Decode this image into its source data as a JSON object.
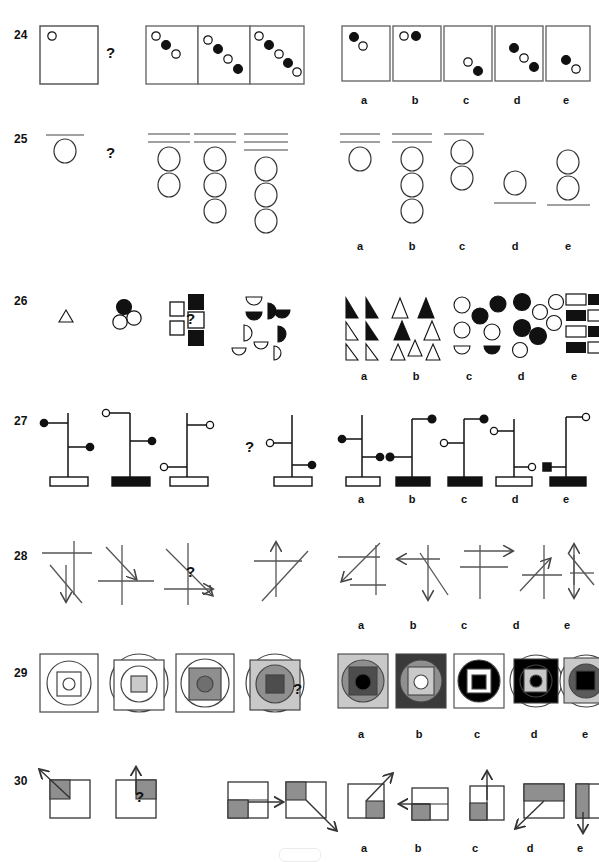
{
  "page": {
    "type": "figural-reasoning-test",
    "question_numbers": [
      "24",
      "25",
      "26",
      "27",
      "28",
      "29",
      "30"
    ],
    "question_mark": "?",
    "option_labels": [
      "a",
      "b",
      "c",
      "d",
      "e"
    ],
    "colors": {
      "ink": "#1a1a1a",
      "frame": "#555555",
      "fill_black": "#000000",
      "fill_white": "#ffffff",
      "gray_light": "#c9c9c9",
      "gray_mid": "#8f8f8f",
      "gray_dark": "#4d4d4d",
      "gray_square": "#888888",
      "background": "#ffffff"
    }
  },
  "rows": [
    {
      "number": "24",
      "description": "Boxes containing a diagonal chain of alternating open and filled circles.",
      "stem": [
        {
          "name": "stem-box-1",
          "circles": [
            "open"
          ]
        },
        {
          "name": "stem-box-2",
          "circles": [
            "open",
            "filled",
            "open"
          ]
        },
        {
          "name": "stem-box-3",
          "circles": [
            "open",
            "filled",
            "open",
            "filled"
          ]
        },
        {
          "name": "stem-box-4",
          "circles": [
            "open",
            "filled",
            "open",
            "filled",
            "open"
          ]
        }
      ],
      "options": [
        {
          "label": "a",
          "circles": [
            "filled",
            "open"
          ],
          "position": "top-left"
        },
        {
          "label": "b",
          "circles": [
            "open",
            "filled"
          ],
          "position": "top-left-horizontal"
        },
        {
          "label": "c",
          "circles": [
            "open",
            "filled"
          ],
          "position": "bottom-right"
        },
        {
          "label": "d",
          "circles": [
            "filled",
            "open",
            "filled"
          ],
          "position": "center"
        },
        {
          "label": "e",
          "circles": [
            "filled",
            "open"
          ],
          "position": "bottom-right"
        }
      ]
    },
    {
      "number": "25",
      "description": "Horizontal lines above a vertical stack of circles.",
      "stem": [
        {
          "name": "stem-group-1",
          "lines": 1,
          "circles": 1,
          "lines_position": "above"
        },
        {
          "name": "stem-group-2",
          "lines": 2,
          "circles": 2,
          "lines_position": "above"
        },
        {
          "name": "stem-group-3",
          "lines": 2,
          "circles": 3,
          "lines_position": "above"
        },
        {
          "name": "stem-group-4",
          "lines": 3,
          "circles": 3,
          "lines_position": "above"
        }
      ],
      "options": [
        {
          "label": "a",
          "lines": 2,
          "circles": 1,
          "lines_position": "above"
        },
        {
          "label": "b",
          "lines": 2,
          "circles": 3,
          "lines_position": "above"
        },
        {
          "label": "c",
          "lines": 1,
          "circles": 2,
          "lines_position": "above"
        },
        {
          "label": "d",
          "lines": 1,
          "circles": 1,
          "lines_position": "below"
        },
        {
          "label": "e",
          "lines": 1,
          "circles": 2,
          "lines_position": "below"
        }
      ]
    },
    {
      "number": "26",
      "description": "Growing clusters of shapes: triangle, circles, squares, half-circles.",
      "stem": [
        {
          "name": "stem-cluster-1",
          "shape": "triangle",
          "count": 1
        },
        {
          "name": "stem-cluster-2",
          "shape": "circle",
          "count": 3
        },
        {
          "name": "stem-cluster-3",
          "shape": "square",
          "count": 5
        },
        {
          "name": "stem-cluster-4",
          "shape": "half-circle",
          "count": 8
        }
      ],
      "options": [
        {
          "label": "a",
          "shape": "right-triangle",
          "count": 6
        },
        {
          "label": "b",
          "shape": "triangle",
          "count": 6
        },
        {
          "label": "c",
          "shape": "circle-and-half-circle",
          "count": 7
        },
        {
          "label": "d",
          "shape": "circle",
          "count": 7
        },
        {
          "label": "e",
          "shape": "rectangle",
          "count": 8
        }
      ]
    },
    {
      "number": "27",
      "description": "Vertical pole on a rectangular base with two horizontal arms ending in circles.",
      "stem": [
        {
          "name": "stem-pole-1",
          "base": "white",
          "arms": [
            {
              "side": "left",
              "height": "upper",
              "knob": "filled"
            },
            {
              "side": "right",
              "height": "lower",
              "knob": "filled"
            }
          ]
        },
        {
          "name": "stem-pole-2",
          "base": "black",
          "arms": [
            {
              "side": "left",
              "height": "top",
              "knob": "open"
            },
            {
              "side": "right",
              "height": "middle",
              "knob": "filled"
            }
          ]
        },
        {
          "name": "stem-pole-3",
          "base": "white",
          "arms": [
            {
              "side": "right",
              "height": "top",
              "knob": "open"
            },
            {
              "side": "left",
              "height": "bottom",
              "knob": "open"
            }
          ]
        },
        {
          "name": "stem-pole-4",
          "base": "white",
          "arms": [
            {
              "side": "left",
              "height": "middle",
              "knob": "open"
            },
            {
              "side": "right",
              "height": "bottom",
              "knob": "filled"
            }
          ]
        }
      ],
      "options": [
        {
          "label": "a",
          "base": "white",
          "arms": [
            {
              "side": "left",
              "height": "upper",
              "knob": "filled"
            },
            {
              "side": "right",
              "height": "lower",
              "knob": "filled"
            }
          ]
        },
        {
          "label": "b",
          "base": "black",
          "arms": [
            {
              "side": "right",
              "height": "top",
              "knob": "filled"
            },
            {
              "side": "left",
              "height": "lower",
              "knob": "filled"
            }
          ]
        },
        {
          "label": "c",
          "base": "black",
          "arms": [
            {
              "side": "right",
              "height": "top",
              "knob": "filled"
            },
            {
              "side": "left",
              "height": "middle",
              "knob": "open"
            }
          ]
        },
        {
          "label": "d",
          "base": "white",
          "arms": [
            {
              "side": "left",
              "height": "upper",
              "knob": "open"
            },
            {
              "side": "right",
              "height": "lower",
              "knob": "open"
            }
          ]
        },
        {
          "label": "e",
          "base": "black",
          "arms": [
            {
              "side": "right",
              "height": "top",
              "knob": "open"
            },
            {
              "side": "left",
              "height": "lower",
              "knob": "filled-square"
            }
          ]
        }
      ]
    },
    {
      "number": "28",
      "description": "Crossing straight lines where one line carries an arrow head.",
      "stem": [
        {
          "name": "stem-lines-1",
          "arrow": "down"
        },
        {
          "name": "stem-lines-2",
          "arrow": "down-right"
        },
        {
          "name": "stem-lines-3",
          "arrow": "right"
        },
        {
          "name": "stem-lines-4",
          "arrow": "up"
        }
      ],
      "options": [
        {
          "label": "a",
          "arrow": "down-left"
        },
        {
          "label": "b",
          "arrow": "left-and-down"
        },
        {
          "label": "c",
          "arrow": "right"
        },
        {
          "label": "d",
          "arrow": "up-right"
        },
        {
          "label": "e",
          "arrow": "up-and-down"
        }
      ]
    },
    {
      "number": "29",
      "description": "Nested square/circle figures that grow progressively darker toward the centre.",
      "stem": [
        {
          "name": "stem-nest-1",
          "outer": "square",
          "shades": [
            "white",
            "white",
            "white",
            "white"
          ]
        },
        {
          "name": "stem-nest-2",
          "outer": "circle",
          "shades": [
            "white",
            "white",
            "white",
            "light-gray"
          ]
        },
        {
          "name": "stem-nest-3",
          "outer": "square",
          "shades": [
            "white",
            "white",
            "gray",
            "gray"
          ]
        },
        {
          "name": "stem-nest-4",
          "outer": "circle",
          "shades": [
            "light-gray",
            "gray",
            "dark-gray",
            "dark-gray"
          ]
        }
      ],
      "options": [
        {
          "label": "a",
          "outer": "square",
          "shades": [
            "light-gray",
            "gray",
            "dark-gray",
            "black"
          ]
        },
        {
          "label": "b",
          "outer": "square",
          "shades": [
            "dark-gray",
            "gray",
            "light-gray",
            "white"
          ]
        },
        {
          "label": "c",
          "outer": "square",
          "shades": [
            "white",
            "black",
            "white",
            "black"
          ]
        },
        {
          "label": "d",
          "outer": "circle",
          "shades": [
            "black",
            "black",
            "light-gray",
            "black"
          ]
        },
        {
          "label": "e",
          "outer": "circle",
          "shades": [
            "light-gray",
            "gray",
            "dark-gray",
            "black"
          ]
        }
      ]
    },
    {
      "number": "30",
      "description": "Square divided into quadrants with one shaded quadrant and an arrow pointing away from it.",
      "stem": [
        {
          "name": "stem-square-1",
          "shaded": "top-left",
          "arrow": "up-left"
        },
        {
          "name": "stem-square-2",
          "shaded": "top-right",
          "arrow": "up"
        },
        {
          "name": "stem-square-3",
          "shaded": "bottom-left",
          "arrow": "right"
        },
        {
          "name": "stem-square-4",
          "shaded": "top-left",
          "arrow": "down-right"
        }
      ],
      "options": [
        {
          "label": "a",
          "shaded": "bottom-right",
          "arrow": "up-right"
        },
        {
          "label": "b",
          "shaded": "bottom-left",
          "arrow": "left"
        },
        {
          "label": "c",
          "shaded": "bottom-left",
          "arrow": "up"
        },
        {
          "label": "d",
          "shaded": "top-half",
          "arrow": "down-left"
        },
        {
          "label": "e",
          "shaded": "left-half",
          "arrow": "down"
        }
      ]
    }
  ]
}
